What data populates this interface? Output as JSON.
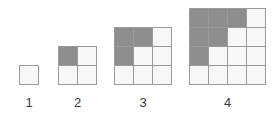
{
  "diagram": {
    "type": "growing-square-grid-sequence",
    "background_color": "#ffffff",
    "shaded_cell_color": "#8d8d8d",
    "empty_cell_color": "#f7f7f7",
    "grid_line_color": "#9a9a9a",
    "label_color": "#3a3a3a",
    "cell_size_px": 18,
    "figures": [
      {
        "label": "1",
        "size": 1,
        "left_px": 19,
        "total_cells": 1,
        "shaded_count": 0,
        "empty_count": 1,
        "rows": [
          [
            "empty"
          ]
        ]
      },
      {
        "label": "2",
        "size": 2,
        "left_px": 58,
        "total_cells": 4,
        "shaded_count": 1,
        "empty_count": 3,
        "rows": [
          [
            "shaded",
            "empty"
          ],
          [
            "empty",
            "empty"
          ]
        ]
      },
      {
        "label": "3",
        "size": 3,
        "left_px": 114,
        "total_cells": 9,
        "shaded_count": 3,
        "empty_count": 6,
        "rows": [
          [
            "shaded",
            "shaded",
            "empty"
          ],
          [
            "shaded",
            "empty",
            "empty"
          ],
          [
            "empty",
            "empty",
            "empty"
          ]
        ]
      },
      {
        "label": "4",
        "size": 4,
        "left_px": 189,
        "total_cells": 16,
        "shaded_count": 6,
        "empty_count": 10,
        "rows": [
          [
            "shaded",
            "shaded",
            "shaded",
            "empty"
          ],
          [
            "shaded",
            "shaded",
            "empty",
            "empty"
          ],
          [
            "shaded",
            "empty",
            "empty",
            "empty"
          ],
          [
            "empty",
            "empty",
            "empty",
            "empty"
          ]
        ]
      }
    ]
  }
}
